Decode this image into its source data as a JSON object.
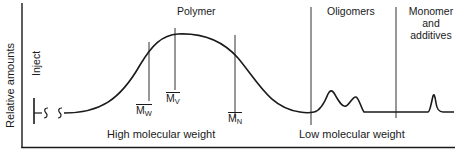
{
  "diagram": {
    "y_axis_label": "Relative amounts",
    "inject_label": "Inject",
    "region_labels": {
      "polymer": "Polymer",
      "oligomers": "Oligomers",
      "monomer_line1": "Monomer",
      "monomer_line2": "and",
      "monomer_line3": "additives"
    },
    "bottom_labels": {
      "high": "High molecular weight",
      "low": "Low molecular weight"
    },
    "markers": {
      "mw": {
        "symbol": "M",
        "sub": "W"
      },
      "mv": {
        "symbol": "M",
        "sub": "V"
      },
      "mn": {
        "symbol": "M",
        "sub": "N"
      }
    },
    "line_color": "#1a1a1a",
    "background": "#ffffff"
  }
}
